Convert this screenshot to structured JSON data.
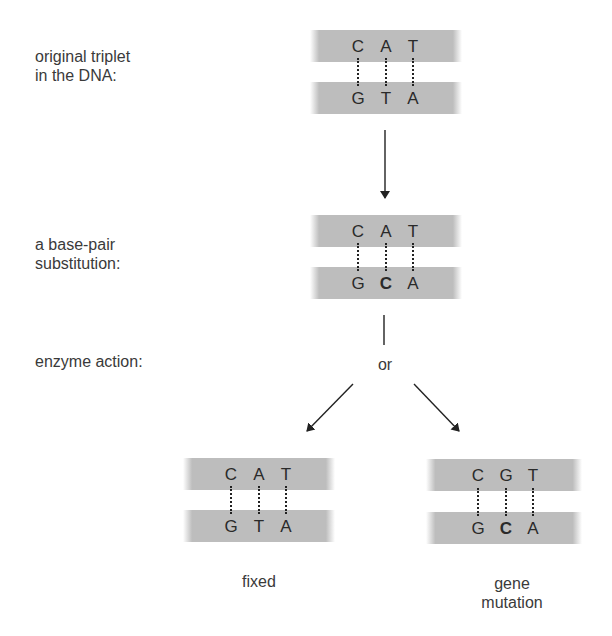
{
  "labels": {
    "original_line1": "original triplet",
    "original_line2": "in the DNA:",
    "substitution_line1": "a base-pair",
    "substitution_line2": "substitution:",
    "enzyme": "enzyme action:",
    "or": "or",
    "fixed": "fixed",
    "mutation_line1": "gene",
    "mutation_line2": "mutation"
  },
  "triplets": {
    "original": {
      "top": [
        "C",
        "A",
        "T"
      ],
      "bottom": [
        "G",
        "T",
        "A"
      ]
    },
    "substitution": {
      "top": [
        "C",
        "A",
        "T"
      ],
      "bottom": [
        "G",
        "C",
        "A"
      ],
      "highlight": "bottom.1"
    },
    "fixed": {
      "top": [
        "C",
        "A",
        "T"
      ],
      "bottom": [
        "G",
        "T",
        "A"
      ]
    },
    "mutation": {
      "top": [
        "C",
        "G",
        "T"
      ],
      "bottom": [
        "G",
        "C",
        "A"
      ],
      "highlight": "bottom.1"
    }
  },
  "colors": {
    "strand": "#bdbdbd",
    "text": "#333333",
    "arrow": "#222222"
  }
}
